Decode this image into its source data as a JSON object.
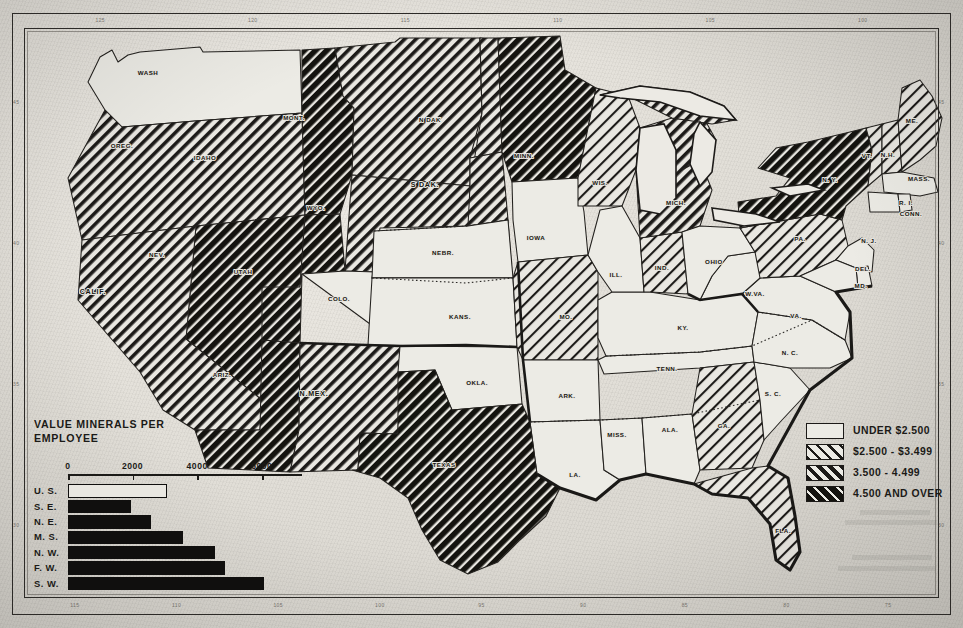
{
  "document": {
    "kind": "thematic-map",
    "subject": "United States value of minerals per employee by state"
  },
  "chart_panel": {
    "title": "VALUE MINERALS PER\nEMPLOYEE"
  },
  "legend": {
    "items": [
      {
        "label": "UNDER $2.500",
        "pattern": "none",
        "swatch_name": "legend-swatch-under-2500"
      },
      {
        "label": "$2.500 - $3.499",
        "pattern": "light",
        "swatch_name": "legend-swatch-2500-3499"
      },
      {
        "label": "3.500 -  4.499",
        "pattern": "medium",
        "swatch_name": "legend-swatch-3500-4499"
      },
      {
        "label": "4.500 AND OVER",
        "pattern": "dark",
        "swatch_name": "legend-swatch-4500-over"
      }
    ]
  },
  "rulers": {
    "top": [
      "125",
      "120",
      "115",
      "110",
      "105",
      "100"
    ],
    "bottom": [
      "115",
      "110",
      "105",
      "100",
      "95",
      "90",
      "85",
      "80",
      "75"
    ],
    "left": [
      "45",
      "40",
      "35",
      "30"
    ],
    "right": [
      "45",
      "40",
      "35",
      "30"
    ]
  },
  "chart_data": {
    "type": "bar",
    "title": "VALUE MINERALS PER EMPLOYEE",
    "orientation": "horizontal",
    "categories": [
      "U. S.",
      "S. E.",
      "N. E.",
      "M. S.",
      "N. W.",
      "F. W.",
      "S. W."
    ],
    "values": [
      3000,
      1900,
      2500,
      3500,
      4500,
      4800,
      6000
    ],
    "bar_styles": [
      "hollow",
      "solid",
      "solid",
      "solid",
      "solid",
      "solid",
      "solid"
    ],
    "xlabel": "",
    "ylabel": "",
    "xlim": [
      0,
      7000
    ],
    "xticks": [
      0,
      2000,
      4000,
      6000
    ],
    "xtick_labels": [
      "0",
      "2000",
      "4000",
      "6000"
    ],
    "grid": false,
    "legend_position": "none"
  },
  "map": {
    "labels": [
      {
        "name": "WASH",
        "x": 148,
        "y": 75,
        "shade": "none"
      },
      {
        "name": "OREG.",
        "x": 122,
        "y": 148,
        "shade": "light"
      },
      {
        "name": "IDAHO",
        "x": 205,
        "y": 160,
        "shade": "dark"
      },
      {
        "name": "MONT.",
        "x": 294,
        "y": 120,
        "shade": "medium"
      },
      {
        "name": "WYO.",
        "x": 316,
        "y": 210,
        "shade": "medium"
      },
      {
        "name": "N DAK",
        "x": 430,
        "y": 122,
        "shade": "medium"
      },
      {
        "name": "S DAK.",
        "x": 425,
        "y": 187,
        "shade": "medium"
      },
      {
        "name": "NEBR.",
        "x": 443,
        "y": 255,
        "shade": "none"
      },
      {
        "name": "COLO.",
        "x": 339,
        "y": 301,
        "shade": "none"
      },
      {
        "name": "KANS.",
        "x": 460,
        "y": 319,
        "shade": "none"
      },
      {
        "name": "NEV.",
        "x": 157,
        "y": 257,
        "shade": "dark"
      },
      {
        "name": "UTAH",
        "x": 243,
        "y": 274,
        "shade": "dark"
      },
      {
        "name": "CALIF.",
        "x": 93,
        "y": 294,
        "shade": "medium"
      },
      {
        "name": "ARIZ.",
        "x": 222,
        "y": 377,
        "shade": "dark"
      },
      {
        "name": "N.MEX.",
        "x": 314,
        "y": 396,
        "shade": "medium"
      },
      {
        "name": "TEXAS",
        "x": 444,
        "y": 467,
        "shade": "dark"
      },
      {
        "name": "OKLA.",
        "x": 477,
        "y": 385,
        "shade": "none"
      },
      {
        "name": "MINN.",
        "x": 524,
        "y": 158,
        "shade": "dark"
      },
      {
        "name": "IOWA",
        "x": 536,
        "y": 240,
        "shade": "none"
      },
      {
        "name": "MO.",
        "x": 566,
        "y": 319,
        "shade": "light"
      },
      {
        "name": "ARK.",
        "x": 567,
        "y": 398,
        "shade": "none"
      },
      {
        "name": "LA.",
        "x": 575,
        "y": 477,
        "shade": "none"
      },
      {
        "name": "WIS.",
        "x": 600,
        "y": 185,
        "shade": "light"
      },
      {
        "name": "ILL.",
        "x": 616,
        "y": 277,
        "shade": "none"
      },
      {
        "name": "MISS.",
        "x": 617,
        "y": 437,
        "shade": "none"
      },
      {
        "name": "MICH.",
        "x": 676,
        "y": 205,
        "shade": "light"
      },
      {
        "name": "IND.",
        "x": 662,
        "y": 270,
        "shade": "light"
      },
      {
        "name": "OHIO",
        "x": 714,
        "y": 264,
        "shade": "none"
      },
      {
        "name": "KY.",
        "x": 683,
        "y": 330,
        "shade": "none"
      },
      {
        "name": "TENN.",
        "x": 667,
        "y": 371,
        "shade": "none"
      },
      {
        "name": "ALA.",
        "x": 670,
        "y": 432,
        "shade": "none"
      },
      {
        "name": "GA.",
        "x": 724,
        "y": 428,
        "shade": "light"
      },
      {
        "name": "W.VA.",
        "x": 755,
        "y": 296,
        "shade": "none"
      },
      {
        "name": "VA.",
        "x": 796,
        "y": 318,
        "shade": "none"
      },
      {
        "name": "N. C.",
        "x": 790,
        "y": 355,
        "shade": "none"
      },
      {
        "name": "S. C.",
        "x": 773,
        "y": 396,
        "shade": "none"
      },
      {
        "name": "FLA.",
        "x": 783,
        "y": 533,
        "shade": "light"
      },
      {
        "name": "PA.",
        "x": 800,
        "y": 241,
        "shade": "light"
      },
      {
        "name": "N. Y.",
        "x": 830,
        "y": 182,
        "shade": "dark"
      },
      {
        "name": "VT.",
        "x": 867,
        "y": 158,
        "shade": "light"
      },
      {
        "name": "N.H.",
        "x": 888,
        "y": 157,
        "shade": "light"
      },
      {
        "name": "ME.",
        "x": 912,
        "y": 123,
        "shade": "light"
      },
      {
        "name": "MASS.",
        "x": 919,
        "y": 181,
        "shade": "none"
      },
      {
        "name": "R. I.",
        "x": 906,
        "y": 205,
        "shade": "none"
      },
      {
        "name": "CONN.",
        "x": 911,
        "y": 216,
        "shade": "none"
      },
      {
        "name": "N. J.",
        "x": 869,
        "y": 243,
        "shade": "none"
      },
      {
        "name": "DEL.",
        "x": 863,
        "y": 271,
        "shade": "none"
      },
      {
        "name": "MD.",
        "x": 861,
        "y": 288,
        "shade": "none"
      }
    ]
  }
}
